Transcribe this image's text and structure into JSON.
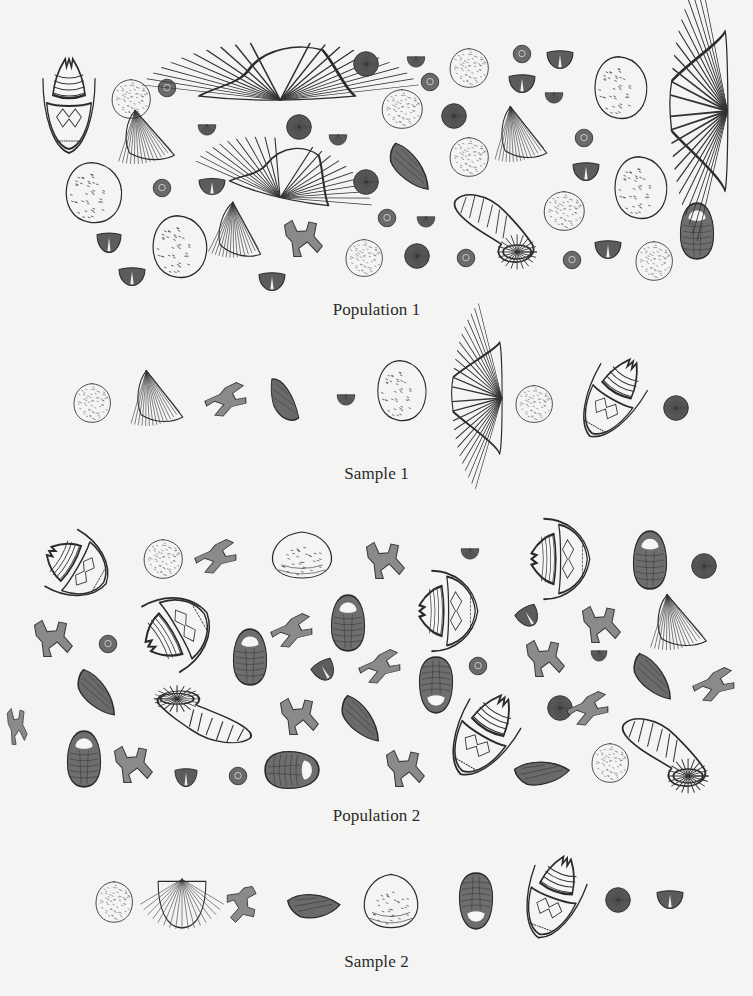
{
  "figure": {
    "background": "#f4f4f2",
    "ink": "#2b2b2b",
    "sections": [
      {
        "id": "population1",
        "label": "Population 1",
        "label_y": 310
      },
      {
        "id": "sample1",
        "label": "Sample 1",
        "label_y": 474
      },
      {
        "id": "population2",
        "label": "Population 2",
        "label_y": 816
      },
      {
        "id": "sample2",
        "label": "Sample 2",
        "label_y": 962
      }
    ]
  },
  "fossils": [
    {
      "section": "population1",
      "type": "crinoid-calyx",
      "x": 38,
      "y": 55,
      "w": 62,
      "h": 100,
      "rot": 0
    },
    {
      "section": "population1",
      "type": "coral-disc",
      "x": 110,
      "y": 78,
      "w": 42,
      "h": 42,
      "rot": 0
    },
    {
      "section": "population1",
      "type": "small-button",
      "x": 157,
      "y": 78,
      "w": 20,
      "h": 20,
      "rot": 0
    },
    {
      "section": "population1",
      "type": "spiriferid-wide",
      "x": 196,
      "y": 38,
      "w": 162,
      "h": 66,
      "rot": 0
    },
    {
      "section": "population1",
      "type": "fan-shell",
      "x": 124,
      "y": 106,
      "w": 56,
      "h": 56,
      "rot": 0
    },
    {
      "section": "population1",
      "type": "small-cup",
      "x": 197,
      "y": 120,
      "w": 20,
      "h": 16,
      "rot": 0
    },
    {
      "section": "population1",
      "type": "sea-urchin",
      "x": 285,
      "y": 113,
      "w": 28,
      "h": 28,
      "rot": 0
    },
    {
      "section": "population1",
      "type": "small-cup",
      "x": 328,
      "y": 130,
      "w": 20,
      "h": 16,
      "rot": 0
    },
    {
      "section": "population1",
      "type": "spiriferid-wide",
      "x": 232,
      "y": 136,
      "w": 106,
      "h": 66,
      "rot": 14
    },
    {
      "section": "population1",
      "type": "clam-round",
      "x": 63,
      "y": 160,
      "w": 62,
      "h": 66,
      "rot": 0
    },
    {
      "section": "population1",
      "type": "small-button",
      "x": 152,
      "y": 178,
      "w": 20,
      "h": 20,
      "rot": 0
    },
    {
      "section": "population1",
      "type": "brachiopod-small",
      "x": 198,
      "y": 176,
      "w": 28,
      "h": 20,
      "rot": 0
    },
    {
      "section": "population1",
      "type": "fan-shell",
      "x": 218,
      "y": 200,
      "w": 52,
      "h": 58,
      "rot": 10
    },
    {
      "section": "population1",
      "type": "bryozoan-twig",
      "x": 282,
      "y": 218,
      "w": 42,
      "h": 40,
      "rot": 0
    },
    {
      "section": "population1",
      "type": "clam-round",
      "x": 150,
      "y": 213,
      "w": 60,
      "h": 68,
      "rot": 0
    },
    {
      "section": "population1",
      "type": "brachiopod-small",
      "x": 96,
      "y": 230,
      "w": 26,
      "h": 24,
      "rot": 0
    },
    {
      "section": "population1",
      "type": "brachiopod-small",
      "x": 118,
      "y": 265,
      "w": 28,
      "h": 22,
      "rot": 0
    },
    {
      "section": "population1",
      "type": "brachiopod-small",
      "x": 258,
      "y": 270,
      "w": 28,
      "h": 22,
      "rot": 0
    },
    {
      "section": "population1",
      "type": "sea-urchin",
      "x": 352,
      "y": 50,
      "w": 28,
      "h": 28,
      "rot": 0
    },
    {
      "section": "population1",
      "type": "sea-urchin",
      "x": 352,
      "y": 168,
      "w": 28,
      "h": 28,
      "rot": 0
    },
    {
      "section": "population1",
      "type": "coral-disc",
      "x": 344,
      "y": 238,
      "w": 40,
      "h": 40,
      "rot": 0
    },
    {
      "section": "population1",
      "type": "small-cup",
      "x": 406,
      "y": 52,
      "w": 20,
      "h": 16,
      "rot": 0
    },
    {
      "section": "population1",
      "type": "small-button",
      "x": 420,
      "y": 72,
      "w": 20,
      "h": 20,
      "rot": 0
    },
    {
      "section": "population1",
      "type": "coral-disc",
      "x": 448,
      "y": 47,
      "w": 42,
      "h": 42,
      "rot": 0
    },
    {
      "section": "population1",
      "type": "coral-disc",
      "x": 380,
      "y": 88,
      "w": 44,
      "h": 42,
      "rot": 0
    },
    {
      "section": "population1",
      "type": "sea-urchin",
      "x": 440,
      "y": 102,
      "w": 28,
      "h": 28,
      "rot": 0
    },
    {
      "section": "population1",
      "type": "brachiopod-elongate",
      "x": 384,
      "y": 148,
      "w": 54,
      "h": 38,
      "rot": 25
    },
    {
      "section": "population1",
      "type": "coral-disc",
      "x": 448,
      "y": 136,
      "w": 42,
      "h": 42,
      "rot": 0
    },
    {
      "section": "population1",
      "type": "small-button",
      "x": 377,
      "y": 208,
      "w": 20,
      "h": 20,
      "rot": 0
    },
    {
      "section": "population1",
      "type": "small-cup",
      "x": 416,
      "y": 212,
      "w": 20,
      "h": 16,
      "rot": 0
    },
    {
      "section": "population1",
      "type": "sea-urchin",
      "x": 403,
      "y": 242,
      "w": 28,
      "h": 28,
      "rot": 0
    },
    {
      "section": "population1",
      "type": "small-button",
      "x": 456,
      "y": 248,
      "w": 20,
      "h": 20,
      "rot": 0
    },
    {
      "section": "population1",
      "type": "horn-coral",
      "x": 452,
      "y": 188,
      "w": 88,
      "h": 78,
      "rot": 0
    },
    {
      "section": "population1",
      "type": "small-button",
      "x": 512,
      "y": 44,
      "w": 20,
      "h": 20,
      "rot": 0
    },
    {
      "section": "population1",
      "type": "brachiopod-small",
      "x": 546,
      "y": 48,
      "w": 28,
      "h": 22,
      "rot": 0
    },
    {
      "section": "population1",
      "type": "brachiopod-small",
      "x": 508,
      "y": 72,
      "w": 28,
      "h": 22,
      "rot": 0
    },
    {
      "section": "population1",
      "type": "small-cup",
      "x": 544,
      "y": 88,
      "w": 20,
      "h": 16,
      "rot": 0
    },
    {
      "section": "population1",
      "type": "fan-shell",
      "x": 500,
      "y": 102,
      "w": 52,
      "h": 58,
      "rot": 0
    },
    {
      "section": "population1",
      "type": "small-button",
      "x": 574,
      "y": 128,
      "w": 20,
      "h": 20,
      "rot": 0
    },
    {
      "section": "population1",
      "type": "brachiopod-small",
      "x": 572,
      "y": 160,
      "w": 28,
      "h": 22,
      "rot": 0
    },
    {
      "section": "population1",
      "type": "coral-disc",
      "x": 542,
      "y": 190,
      "w": 44,
      "h": 42,
      "rot": 0
    },
    {
      "section": "population1",
      "type": "brachiopod-small",
      "x": 594,
      "y": 238,
      "w": 28,
      "h": 22,
      "rot": 0
    },
    {
      "section": "population1",
      "type": "small-button",
      "x": 562,
      "y": 250,
      "w": 20,
      "h": 20,
      "rot": 0
    },
    {
      "section": "population1",
      "type": "clam-round",
      "x": 592,
      "y": 54,
      "w": 58,
      "h": 68,
      "rot": 0
    },
    {
      "section": "population1",
      "type": "clam-round",
      "x": 612,
      "y": 154,
      "w": 58,
      "h": 68,
      "rot": 0
    },
    {
      "section": "population1",
      "type": "coral-disc",
      "x": 634,
      "y": 240,
      "w": 40,
      "h": 42,
      "rot": 0
    },
    {
      "section": "population1",
      "type": "trilobite",
      "x": 679,
      "y": 202,
      "w": 36,
      "h": 58,
      "rot": 0
    },
    {
      "section": "population1",
      "type": "spiriferid-tall",
      "x": 668,
      "y": 28,
      "w": 62,
      "h": 166,
      "rot": 0
    },
    {
      "section": "sample1",
      "type": "coral-disc",
      "x": 72,
      "y": 382,
      "w": 40,
      "h": 42,
      "rot": 0
    },
    {
      "section": "sample1",
      "type": "fan-shell",
      "x": 136,
      "y": 366,
      "w": 52,
      "h": 58,
      "rot": 0
    },
    {
      "section": "sample1",
      "type": "bryozoan-twig",
      "x": 212,
      "y": 377,
      "w": 30,
      "h": 46,
      "rot": 70
    },
    {
      "section": "sample1",
      "type": "brachiopod-elongate",
      "x": 270,
      "y": 374,
      "w": 30,
      "h": 52,
      "rot": 0
    },
    {
      "section": "sample1",
      "type": "small-cup",
      "x": 336,
      "y": 390,
      "w": 20,
      "h": 16,
      "rot": 0
    },
    {
      "section": "sample1",
      "type": "clam-round",
      "x": 375,
      "y": 358,
      "w": 54,
      "h": 66,
      "rot": 0
    },
    {
      "section": "sample1",
      "type": "spiriferid-tall",
      "x": 450,
      "y": 340,
      "w": 54,
      "h": 116,
      "rot": 0
    },
    {
      "section": "sample1",
      "type": "coral-disc",
      "x": 514,
      "y": 384,
      "w": 40,
      "h": 40,
      "rot": 0
    },
    {
      "section": "sample1",
      "type": "crinoid-calyx",
      "x": 580,
      "y": 352,
      "w": 64,
      "h": 92,
      "rot": 30
    },
    {
      "section": "sample1",
      "type": "sea-urchin",
      "x": 662,
      "y": 394,
      "w": 28,
      "h": 28,
      "rot": 0
    },
    {
      "section": "population2",
      "type": "crinoid-calyx",
      "x": 38,
      "y": 532,
      "w": 78,
      "h": 70,
      "rot": -60
    },
    {
      "section": "population2",
      "type": "coral-disc",
      "x": 142,
      "y": 538,
      "w": 42,
      "h": 42,
      "rot": 0
    },
    {
      "section": "population2",
      "type": "bryozoan-twig",
      "x": 202,
      "y": 534,
      "w": 30,
      "h": 46,
      "rot": 70
    },
    {
      "section": "population2",
      "type": "clam-wide",
      "x": 270,
      "y": 530,
      "w": 64,
      "h": 50,
      "rot": 0
    },
    {
      "section": "population2",
      "type": "bryozoan-twig",
      "x": 364,
      "y": 540,
      "w": 42,
      "h": 40,
      "rot": 0
    },
    {
      "section": "population2",
      "type": "small-cup",
      "x": 460,
      "y": 544,
      "w": 20,
      "h": 16,
      "rot": 0
    },
    {
      "section": "population2",
      "type": "crinoid-calyx",
      "x": 512,
      "y": 528,
      "w": 96,
      "h": 62,
      "rot": -90
    },
    {
      "section": "population2",
      "type": "trilobite",
      "x": 632,
      "y": 530,
      "w": 36,
      "h": 60,
      "rot": 0
    },
    {
      "section": "population2",
      "type": "sea-urchin",
      "x": 690,
      "y": 552,
      "w": 28,
      "h": 28,
      "rot": 0
    },
    {
      "section": "population2",
      "type": "bryozoan-twig",
      "x": 32,
      "y": 618,
      "w": 42,
      "h": 40,
      "rot": 0
    },
    {
      "section": "population2",
      "type": "small-button",
      "x": 98,
      "y": 634,
      "w": 20,
      "h": 20,
      "rot": 0
    },
    {
      "section": "population2",
      "type": "crinoid-calyx",
      "x": 132,
      "y": 594,
      "w": 90,
      "h": 72,
      "rot": -120
    },
    {
      "section": "population2",
      "type": "trilobite",
      "x": 232,
      "y": 628,
      "w": 36,
      "h": 58,
      "rot": 0
    },
    {
      "section": "population2",
      "type": "bryozoan-twig",
      "x": 278,
      "y": 608,
      "w": 30,
      "h": 46,
      "rot": 70
    },
    {
      "section": "population2",
      "type": "trilobite",
      "x": 330,
      "y": 594,
      "w": 36,
      "h": 58,
      "rot": 0
    },
    {
      "section": "population2",
      "type": "brachiopod-small",
      "x": 312,
      "y": 658,
      "w": 24,
      "h": 24,
      "rot": -30
    },
    {
      "section": "population2",
      "type": "bryozoan-twig",
      "x": 366,
      "y": 644,
      "w": 30,
      "h": 46,
      "rot": 70
    },
    {
      "section": "population2",
      "type": "crinoid-calyx",
      "x": 400,
      "y": 580,
      "w": 96,
      "h": 62,
      "rot": -90
    },
    {
      "section": "population2",
      "type": "brachiopod-small",
      "x": 516,
      "y": 604,
      "w": 24,
      "h": 24,
      "rot": -30
    },
    {
      "section": "population2",
      "type": "bryozoan-twig",
      "x": 580,
      "y": 604,
      "w": 42,
      "h": 40,
      "rot": 0
    },
    {
      "section": "population2",
      "type": "fan-shell",
      "x": 656,
      "y": 590,
      "w": 56,
      "h": 58,
      "rot": 0
    },
    {
      "section": "population2",
      "type": "small-cup",
      "x": 590,
      "y": 646,
      "w": 18,
      "h": 16,
      "rot": 0
    },
    {
      "section": "population2",
      "type": "trilobite",
      "x": 418,
      "y": 656,
      "w": 36,
      "h": 58,
      "rot": 180
    },
    {
      "section": "population2",
      "type": "small-button",
      "x": 468,
      "y": 656,
      "w": 20,
      "h": 20,
      "rot": 0
    },
    {
      "section": "population2",
      "type": "bryozoan-twig",
      "x": 524,
      "y": 638,
      "w": 42,
      "h": 40,
      "rot": 0
    },
    {
      "section": "population2",
      "type": "brachiopod-elongate",
      "x": 628,
      "y": 658,
      "w": 52,
      "h": 38,
      "rot": 25
    },
    {
      "section": "population2",
      "type": "bryozoan-twig",
      "x": 700,
      "y": 662,
      "w": 30,
      "h": 46,
      "rot": 70
    },
    {
      "section": "population2",
      "type": "brachiopod-elongate",
      "x": 72,
      "y": 674,
      "w": 52,
      "h": 38,
      "rot": 25
    },
    {
      "section": "population2",
      "type": "horn-coral",
      "x": 150,
      "y": 688,
      "w": 104,
      "h": 60,
      "rot": 180
    },
    {
      "section": "population2",
      "type": "bryozoan-twig",
      "x": 278,
      "y": 696,
      "w": 42,
      "h": 40,
      "rot": 0
    },
    {
      "section": "population2",
      "type": "brachiopod-elongate",
      "x": 336,
      "y": 700,
      "w": 52,
      "h": 38,
      "rot": 25
    },
    {
      "section": "population2",
      "type": "crinoid-calyx",
      "x": 448,
      "y": 688,
      "w": 70,
      "h": 94,
      "rot": 30
    },
    {
      "section": "population2",
      "type": "sea-urchin",
      "x": 546,
      "y": 694,
      "w": 28,
      "h": 28,
      "rot": 0
    },
    {
      "section": "population2",
      "type": "bryozoan-twig",
      "x": 574,
      "y": 686,
      "w": 30,
      "h": 46,
      "rot": 70
    },
    {
      "section": "population2",
      "type": "horn-coral",
      "x": 620,
      "y": 712,
      "w": 92,
      "h": 78,
      "rot": 0
    },
    {
      "section": "population2",
      "type": "trilobite",
      "x": 66,
      "y": 730,
      "w": 36,
      "h": 58,
      "rot": 0
    },
    {
      "section": "population2",
      "type": "bryozoan-twig",
      "x": 112,
      "y": 744,
      "w": 42,
      "h": 40,
      "rot": 0
    },
    {
      "section": "population2",
      "type": "brachiopod-small",
      "x": 174,
      "y": 766,
      "w": 24,
      "h": 22,
      "rot": 0
    },
    {
      "section": "population2",
      "type": "small-button",
      "x": 228,
      "y": 766,
      "w": 20,
      "h": 20,
      "rot": 0
    },
    {
      "section": "population2",
      "type": "trilobite",
      "x": 272,
      "y": 742,
      "w": 40,
      "h": 56,
      "rot": 90
    },
    {
      "section": "population2",
      "type": "bryozoan-twig",
      "x": 384,
      "y": 748,
      "w": 42,
      "h": 40,
      "rot": 0
    },
    {
      "section": "population2",
      "type": "brachiopod-elongate",
      "x": 516,
      "y": 752,
      "w": 52,
      "h": 38,
      "rot": -30
    },
    {
      "section": "population2",
      "type": "coral-disc",
      "x": 590,
      "y": 742,
      "w": 40,
      "h": 42,
      "rot": 0
    },
    {
      "section": "population2",
      "type": "bryozoan-twig",
      "x": 6,
      "y": 706,
      "w": 22,
      "h": 40,
      "rot": 0
    },
    {
      "section": "sample2",
      "type": "coral-disc",
      "x": 94,
      "y": 880,
      "w": 40,
      "h": 44,
      "rot": 0
    },
    {
      "section": "sample2",
      "type": "fan-shell-down",
      "x": 156,
      "y": 876,
      "w": 52,
      "h": 54,
      "rot": 0
    },
    {
      "section": "sample2",
      "type": "bryozoan-twig",
      "x": 222,
      "y": 888,
      "w": 40,
      "h": 32,
      "rot": 90
    },
    {
      "section": "sample2",
      "type": "brachiopod-elongate",
      "x": 290,
      "y": 884,
      "w": 48,
      "h": 40,
      "rot": -30
    },
    {
      "section": "sample2",
      "type": "clam-wide",
      "x": 362,
      "y": 872,
      "w": 58,
      "h": 58,
      "rot": 0
    },
    {
      "section": "sample2",
      "type": "trilobite",
      "x": 458,
      "y": 872,
      "w": 36,
      "h": 58,
      "rot": 180
    },
    {
      "section": "sample2",
      "type": "crinoid-calyx",
      "x": 520,
      "y": 852,
      "w": 66,
      "h": 90,
      "rot": 20
    },
    {
      "section": "sample2",
      "type": "sea-urchin",
      "x": 604,
      "y": 886,
      "w": 28,
      "h": 28,
      "rot": 0
    },
    {
      "section": "sample2",
      "type": "brachiopod-small",
      "x": 656,
      "y": 888,
      "w": 28,
      "h": 22,
      "rot": 0
    }
  ],
  "legend_icons": {
    "crinoid-calyx": "crinoid-calyx-icon",
    "coral-disc": "coral-disc-icon",
    "small-button": "crinoid-stem-button-icon",
    "spiriferid-wide": "spiriferid-brachiopod-icon",
    "spiriferid-tall": "spiriferid-brachiopod-icon",
    "fan-shell": "fan-shell-icon",
    "fan-shell-down": "fan-shell-icon",
    "small-cup": "small-cup-coral-icon",
    "sea-urchin": "sea-urchin-icon",
    "clam-round": "clam-shell-icon",
    "clam-wide": "clam-shell-icon",
    "brachiopod-small": "small-brachiopod-icon",
    "brachiopod-elongate": "elongate-brachiopod-icon",
    "bryozoan-twig": "bryozoan-twig-icon",
    "horn-coral": "horn-coral-icon",
    "trilobite": "trilobite-icon"
  }
}
